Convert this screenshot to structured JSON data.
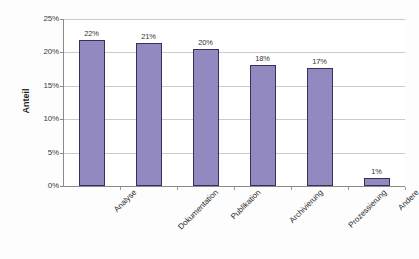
{
  "chart_data": {
    "type": "bar",
    "title": "",
    "xlabel": "",
    "ylabel": "Anteil",
    "ylim": [
      0,
      25
    ],
    "ytick_labels": [
      "0%",
      "5%",
      "10%",
      "15%",
      "20%",
      "25%"
    ],
    "ytick_values": [
      0,
      5,
      10,
      15,
      20,
      25
    ],
    "grid": "horizontal",
    "legend": "none",
    "bar_color": "#9189bf",
    "bar_outline_color": "#32325a",
    "gridline_color": "#b9b9b9",
    "axis_color": "#8a8a8a",
    "categories": [
      "Analyse",
      "Dokumentation",
      "Publikation",
      "Archivierung",
      "Prozessierung",
      "Andere"
    ],
    "values": [
      21.9,
      21.4,
      20.5,
      18.1,
      17.6,
      1.2
    ],
    "data_labels": [
      "22%",
      "21%",
      "20%",
      "18%",
      "17%",
      "1%"
    ]
  }
}
